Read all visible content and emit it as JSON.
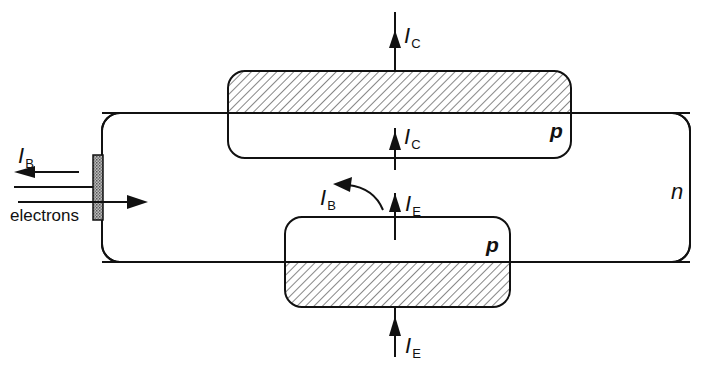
{
  "diagram": {
    "title": "",
    "regions": {
      "base": {
        "label": "n",
        "type": "n-type"
      },
      "collector": {
        "label": "p",
        "type": "p-type"
      },
      "emitter": {
        "label": "p",
        "type": "p-type"
      }
    },
    "currents": {
      "ic_top": {
        "symbol": "I",
        "subscript": "C"
      },
      "ic_inner": {
        "symbol": "I",
        "subscript": "C"
      },
      "ie_inner": {
        "symbol": "I",
        "subscript": "E"
      },
      "ie_bottom": {
        "symbol": "I",
        "subscript": "E"
      },
      "ib_inner": {
        "symbol": "I",
        "subscript": "B"
      },
      "ib_left": {
        "symbol": "I",
        "subscript": "B"
      }
    },
    "base_contact": {
      "label": "electrons"
    },
    "colors": {
      "line": "#111111",
      "contact_fill": "#9a9a9a",
      "hatch": "#222222",
      "background": "#ffffff"
    }
  }
}
